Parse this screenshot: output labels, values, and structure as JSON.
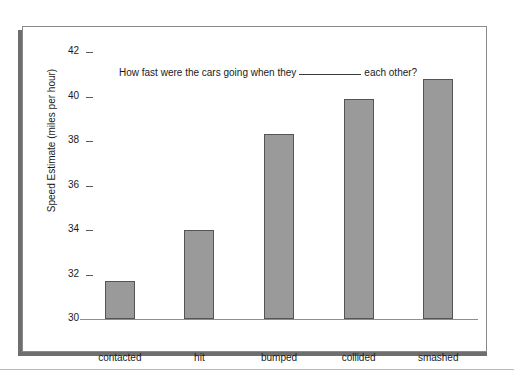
{
  "chart_data": {
    "type": "bar",
    "title_parts": {
      "before": "How fast were the cars going when they",
      "blank": "__________",
      "after": "each other?"
    },
    "xlabel": "",
    "ylabel": "Speed Estimate (miles per hour)",
    "categories": [
      "contacted",
      "hit",
      "bumped",
      "collided",
      "smashed"
    ],
    "values": [
      31.7,
      34.0,
      38.3,
      39.9,
      40.8
    ],
    "ylim": [
      30,
      42
    ],
    "yticks": [
      30,
      32,
      34,
      36,
      38,
      40,
      42
    ],
    "ytick_labels": [
      "30",
      "32",
      "34",
      "36",
      "38",
      "40",
      "42"
    ],
    "grid": false,
    "legend": false,
    "bar_color": "#9a9a9a",
    "bar_edge_color": "#545454",
    "background_color": "#ffffff",
    "frame_color": "#8a8a8a",
    "shadow_color": "#6e6e6e",
    "axis_color": "#8e8e8e",
    "text_color": "#1a1a1a"
  }
}
